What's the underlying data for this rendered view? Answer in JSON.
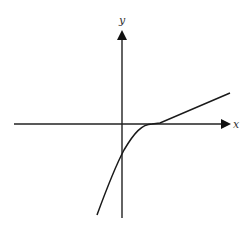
{
  "diagram": {
    "type": "function-graph",
    "axes": {
      "x_label": "x",
      "y_label": "y"
    },
    "curve": {
      "description": "Increasing concave-down curve crossing the negative y-axis, tangent to the x-axis at a positive x, then continuing as a straight line with positive slope",
      "y_intercept_sign": "negative",
      "tangent_point_on_x_axis": "positive x"
    },
    "colors": {
      "stroke": "#1a1a1a",
      "background": "#ffffff"
    }
  }
}
